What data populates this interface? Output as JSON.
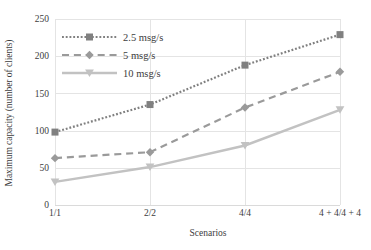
{
  "chart_data": {
    "type": "line",
    "title": "",
    "xlabel": "Scenarios",
    "ylabel": "Maximum capacity (number of clients)",
    "categories": [
      "1/1",
      "2/2",
      "4/4",
      "4 + 4/4 + 4"
    ],
    "yticks": [
      "0",
      "50",
      "100",
      "150",
      "200",
      "250"
    ],
    "ylim": [
      0,
      250
    ],
    "grid": true,
    "legend_position": "upper-left",
    "series": [
      {
        "name": "2.5 msg/s",
        "values": [
          98,
          135,
          188,
          229
        ],
        "color": "#808080",
        "line_style": "dotted",
        "marker": "square"
      },
      {
        "name": "5 msg/s",
        "values": [
          63,
          71,
          131,
          179
        ],
        "color": "#9a9a9a",
        "line_style": "dashed",
        "marker": "diamond"
      },
      {
        "name": "10 msg/s",
        "values": [
          31,
          51,
          80,
          128
        ],
        "color": "#c2c2c2",
        "line_style": "solid",
        "marker": "triangle-down"
      }
    ]
  }
}
